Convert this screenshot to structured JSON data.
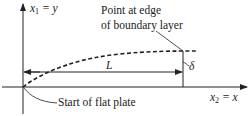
{
  "diagram": {
    "axes": {
      "vertical_label_var": "x",
      "vertical_label_sub": "1",
      "vertical_label_rest": " = y",
      "horizontal_label_var": "x",
      "horizontal_label_sub": "2",
      "horizontal_label_rest": " = x"
    },
    "annotations": {
      "edge_point_line1": "Point at edge",
      "edge_point_line2": "of boundary layer",
      "plate_start": "Start of flat plate",
      "length_symbol": "L",
      "thickness_symbol": "δ"
    },
    "colors": {
      "stroke": "#222222",
      "background": "#ffffff"
    }
  }
}
